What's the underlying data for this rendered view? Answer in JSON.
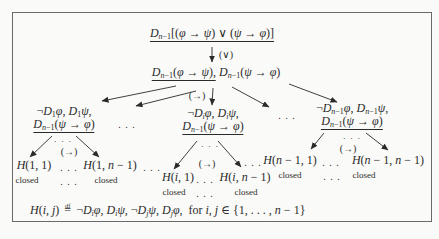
{
  "colors": {
    "ink": "#2a2a2a",
    "frame": "#6a6a6a",
    "bg": "#fafaf8"
  },
  "tree": {
    "root": {
      "formula": [
        {
          "t": "D"
        },
        {
          "t": "n",
          "sub": true
        },
        {
          "t": "−1",
          "sub": true,
          "up": true
        },
        {
          "t": "[(",
          "up": true
        },
        {
          "t": "φ"
        },
        {
          "t": " → ",
          "up": true
        },
        {
          "t": "ψ"
        },
        {
          "t": ") ∨ (",
          "up": true
        },
        {
          "t": "ψ"
        },
        {
          "t": " → ",
          "up": true
        },
        {
          "t": "φ"
        },
        {
          "t": ")]",
          "up": true
        }
      ],
      "rule_label": "(∨)"
    },
    "level2": {
      "underlined": [
        {
          "t": "D"
        },
        {
          "t": "n",
          "sub": true
        },
        {
          "t": "−1",
          "sub": true,
          "up": true
        },
        {
          "t": "(",
          "up": true
        },
        {
          "t": "φ"
        },
        {
          "t": " → ",
          "up": true
        },
        {
          "t": "ψ"
        },
        {
          "t": "),",
          "up": true
        }
      ],
      "rest": [
        {
          "t": "D"
        },
        {
          "t": "n",
          "sub": true
        },
        {
          "t": "−1",
          "sub": true,
          "up": true
        },
        {
          "t": "(",
          "up": true
        },
        {
          "t": "ψ"
        },
        {
          "t": " → ",
          "up": true
        },
        {
          "t": "φ"
        },
        {
          "t": ")",
          "up": true
        }
      ],
      "rule_label": "(→)"
    },
    "level3_gap_left": ". . .",
    "level3_gap_right": ". . .",
    "leaves_gap_left": ". . .",
    "leaves_gap_right": ". . .",
    "branches": {
      "left": {
        "premise_line1": [
          {
            "t": "¬",
            "up": true
          },
          {
            "t": "D"
          },
          {
            "t": "1",
            "sub": true,
            "up": true
          },
          {
            "t": "φ"
          },
          {
            "t": ", ",
            "up": true
          },
          {
            "t": "D"
          },
          {
            "t": "1",
            "sub": true,
            "up": true
          },
          {
            "t": "ψ"
          },
          {
            "t": ",",
            "up": true
          }
        ],
        "premise_line2": [
          {
            "t": "D"
          },
          {
            "t": "n",
            "sub": true
          },
          {
            "t": "−1",
            "sub": true,
            "up": true
          },
          {
            "t": "(",
            "up": true
          },
          {
            "t": "ψ"
          },
          {
            "t": " → ",
            "up": true
          },
          {
            "t": "φ"
          },
          {
            "t": ")",
            "up": true
          }
        ],
        "gap_dots": "· · ·",
        "rule_label": "(→)",
        "leaf1": [
          {
            "t": "H"
          },
          {
            "t": "(1, 1)",
            "up": true
          }
        ],
        "leaf_gap": ". . .",
        "leaf2": [
          {
            "t": "H"
          },
          {
            "t": "(1, ",
            "up": true
          },
          {
            "t": "n"
          },
          {
            "t": " − 1)",
            "up": true
          }
        ],
        "status1": "closed",
        "status_gap": ". . .",
        "status2": "closed"
      },
      "middle": {
        "premise_line1": [
          {
            "t": "¬",
            "up": true
          },
          {
            "t": "D"
          },
          {
            "t": "i",
            "sub": true
          },
          {
            "t": "φ"
          },
          {
            "t": ", ",
            "up": true
          },
          {
            "t": "D"
          },
          {
            "t": "i",
            "sub": true
          },
          {
            "t": "ψ"
          },
          {
            "t": ",",
            "up": true
          }
        ],
        "premise_line2": [
          {
            "t": "D"
          },
          {
            "t": "n",
            "sub": true
          },
          {
            "t": "−1",
            "sub": true,
            "up": true
          },
          {
            "t": "(",
            "up": true
          },
          {
            "t": "ψ"
          },
          {
            "t": " → ",
            "up": true
          },
          {
            "t": "φ"
          },
          {
            "t": ")",
            "up": true
          }
        ],
        "gap_dots": "· · ·",
        "rule_label": "(→)",
        "leaf1": [
          {
            "t": "H"
          },
          {
            "t": "(",
            "up": true
          },
          {
            "t": "i"
          },
          {
            "t": ", 1)",
            "up": true
          }
        ],
        "leaf_gap": ". . .",
        "leaf2": [
          {
            "t": "H"
          },
          {
            "t": "(",
            "up": true
          },
          {
            "t": "i"
          },
          {
            "t": ", ",
            "up": true
          },
          {
            "t": "n"
          },
          {
            "t": " − 1)",
            "up": true
          }
        ],
        "status1": "closed",
        "status_gap": ". . .",
        "status2": "closed"
      },
      "right": {
        "premise_line1": [
          {
            "t": "¬",
            "up": true
          },
          {
            "t": "D"
          },
          {
            "t": "n",
            "sub": true
          },
          {
            "t": "−1",
            "sub": true,
            "up": true
          },
          {
            "t": "φ"
          },
          {
            "t": ", ",
            "up": true
          },
          {
            "t": "D"
          },
          {
            "t": "n",
            "sub": true
          },
          {
            "t": "−1",
            "sub": true,
            "up": true
          },
          {
            "t": "ψ"
          },
          {
            "t": ",",
            "up": true
          }
        ],
        "premise_line2": [
          {
            "t": "D"
          },
          {
            "t": "n",
            "sub": true
          },
          {
            "t": "−1",
            "sub": true,
            "up": true
          },
          {
            "t": "(",
            "up": true
          },
          {
            "t": "ψ"
          },
          {
            "t": " → ",
            "up": true
          },
          {
            "t": "φ"
          },
          {
            "t": ")",
            "up": true
          }
        ],
        "gap_dots": "· · ·",
        "rule_label": "(→)",
        "leaf1": [
          {
            "t": "H"
          },
          {
            "t": "(",
            "up": true
          },
          {
            "t": "n"
          },
          {
            "t": " − 1, 1)",
            "up": true
          }
        ],
        "leaf_gap": ". . .",
        "leaf2": [
          {
            "t": "H"
          },
          {
            "t": "(",
            "up": true
          },
          {
            "t": "n"
          },
          {
            "t": " − 1, ",
            "up": true
          },
          {
            "t": "n"
          },
          {
            "t": " − 1)",
            "up": true
          }
        ],
        "status1": "closed",
        "status_gap": ". . .",
        "status2": "closed"
      }
    }
  },
  "definition": {
    "formula": [
      {
        "t": "H"
      },
      {
        "t": "(",
        "up": true
      },
      {
        "t": "i"
      },
      {
        "t": ", ",
        "up": true
      },
      {
        "t": "j"
      },
      {
        "t": ") ",
        "up": true
      },
      {
        "t": "=",
        "top": "df"
      },
      {
        "t": " ¬",
        "up": true
      },
      {
        "t": "D"
      },
      {
        "t": "i",
        "sub": true
      },
      {
        "t": "φ"
      },
      {
        "t": ", ",
        "up": true
      },
      {
        "t": "D"
      },
      {
        "t": "i",
        "sub": true
      },
      {
        "t": "ψ"
      },
      {
        "t": ", ¬",
        "up": true
      },
      {
        "t": "D"
      },
      {
        "t": "j",
        "sub": true
      },
      {
        "t": "ψ"
      },
      {
        "t": ", ",
        "up": true
      },
      {
        "t": "D"
      },
      {
        "t": "j",
        "sub": true
      },
      {
        "t": "φ"
      },
      {
        "t": ",  for ",
        "up": true
      },
      {
        "t": "i"
      },
      {
        "t": ", ",
        "up": true
      },
      {
        "t": "j"
      },
      {
        "t": " ∈ {1, . . . , ",
        "up": true
      },
      {
        "t": "n"
      },
      {
        "t": " − 1}",
        "up": true
      }
    ]
  }
}
